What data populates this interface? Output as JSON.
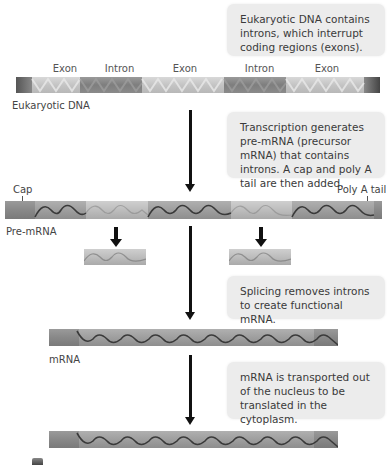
{
  "callouts": {
    "dna": "Eukaryotic DNA contains introns, which interrupt coding regions (exons).",
    "transcription": "Transcription generates pre-mRNA (precursor mRNA) that contains introns. A cap and poly A tail are then added.",
    "splicing": "Splicing removes introns to create functional mRNA.",
    "transport": "mRNA is transported out of the nucleus to be translated in the cytoplasm."
  },
  "dna": {
    "label": "Eukaryotic DNA",
    "segments": [
      {
        "type": "end",
        "label": ""
      },
      {
        "type": "exon",
        "label": "Exon"
      },
      {
        "type": "intron",
        "label": "Intron"
      },
      {
        "type": "exon",
        "label": "Exon"
      },
      {
        "type": "intron",
        "label": "Intron"
      },
      {
        "type": "exon",
        "label": "Exon"
      },
      {
        "type": "end",
        "label": ""
      }
    ]
  },
  "pre_mrna": {
    "label": "Pre-mRNA",
    "cap_label": "Cap",
    "tail_label": "Poly A tail"
  },
  "mrna": {
    "label": "mRNA"
  },
  "colors": {
    "callout_bg": "#ececec",
    "arrow": "#111111",
    "exon": "#c4c4c4",
    "intron": "#7e7e7e"
  }
}
